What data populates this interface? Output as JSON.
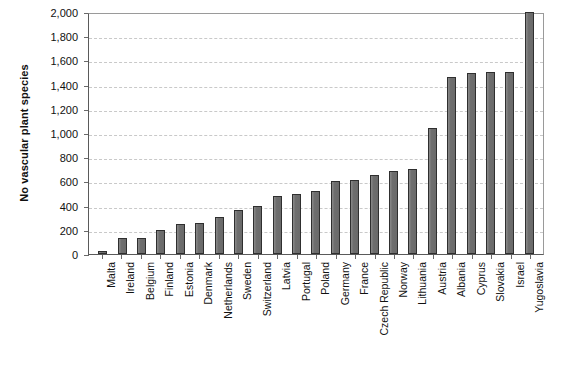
{
  "chart_data": {
    "type": "bar",
    "title": "",
    "xlabel": "",
    "ylabel": "No vascular plant species",
    "ylim": [
      0,
      2000
    ],
    "ytick_labels": [
      "2,000",
      "1,800",
      "1,600",
      "1,400",
      "1,200",
      "1,000",
      "800",
      "600",
      "400",
      "200",
      "0"
    ],
    "yticks": [
      2000,
      1800,
      1600,
      1400,
      1200,
      1000,
      800,
      600,
      400,
      200,
      0
    ],
    "grid": true,
    "legend": "none",
    "bar_color": "#707070",
    "bar_edge_color": "#2f2f2f",
    "gridline_color": "#c9c9c9",
    "axis_color": "#5a5a5a",
    "categories": [
      "Malta",
      "Ireland",
      "Belgium",
      "Finland",
      "Estonia",
      "Denmark",
      "Netherlands",
      "Sweden",
      "Switzerland",
      "Latvia",
      "Portugal",
      "Poland",
      "Germany",
      "France",
      "Czech Republic",
      "Norway",
      "Lithuania",
      "Austria",
      "Albania",
      "Cyprus",
      "Slovakia",
      "Israel",
      "Yugoslavia"
    ],
    "values": [
      25,
      130,
      135,
      200,
      245,
      255,
      310,
      360,
      400,
      480,
      495,
      520,
      600,
      615,
      650,
      685,
      705,
      1045,
      1460,
      1500,
      1505,
      1505,
      2000
    ]
  }
}
